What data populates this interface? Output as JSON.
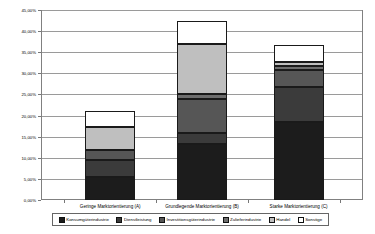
{
  "chart_data": {
    "type": "bar",
    "subtype": "stacked-column",
    "title": "",
    "xlabel": "",
    "ylabel": "",
    "ylim": [
      0,
      45
    ],
    "grid": true,
    "legend_position": "bottom",
    "categories": [
      "Geringe Marktorientierung (A)",
      "Grundlegende Marktorientierung (B)",
      "Starke Marktorientierung (C)"
    ],
    "y_ticks": [
      "0,00%",
      "5,00%",
      "10,00%",
      "15,00%",
      "20,00%",
      "25,00%",
      "30,00%",
      "35,00%",
      "40,00%",
      "45,00%"
    ],
    "y_tick_values": [
      0,
      5,
      10,
      15,
      20,
      25,
      30,
      35,
      40,
      45
    ],
    "series": [
      {
        "name": "Konsumgüterindustrie",
        "color": "#1c1c1c",
        "values": [
          5.5,
          13.2,
          18.5
        ]
      },
      {
        "name": "Dienstleistung",
        "color": "#3b3b3b",
        "values": [
          3.9,
          2.6,
          8.2
        ]
      },
      {
        "name": "Investitionsgüterindustrie",
        "color": "#565656",
        "values": [
          2.5,
          8.2,
          4.0
        ]
      },
      {
        "name": "Zulieferindustrie",
        "color": "#6e6e6e",
        "values": [
          0.0,
          1.1,
          1.0
        ]
      },
      {
        "name": "Handel",
        "color": "#bfbfbf",
        "values": [
          5.3,
          11.9,
          1.0
        ]
      },
      {
        "name": "Sonstige",
        "color": "#ffffff",
        "values": [
          4.0,
          5.3,
          4.0
        ]
      }
    ],
    "totals": [
      21.2,
      42.3,
      36.7
    ]
  }
}
